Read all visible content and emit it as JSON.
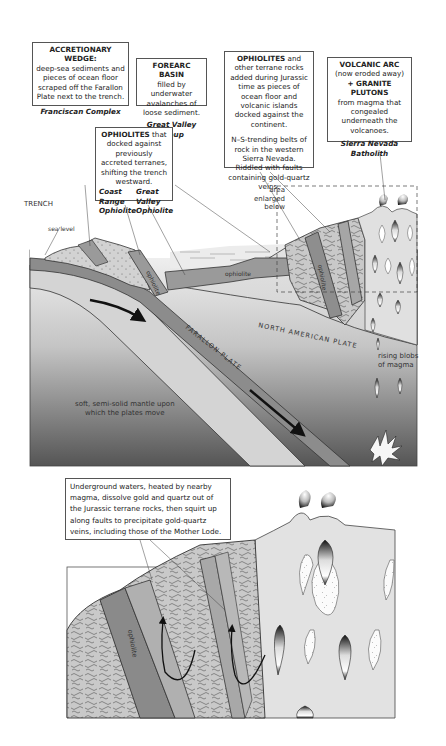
{
  "top_diagram": {
    "callouts": {
      "accretionary_wedge": {
        "title": "ACCRETIONARY WEDGE:",
        "body": "deep-sea sediments and pieces of ocean floor scraped off the Farallon Plate next to the trench.",
        "name": "Franciscan Complex"
      },
      "forearc_basin": {
        "title": "FOREARC BASIN",
        "body": "filled by underwater avalanches of loose sediment.",
        "name": "Great Valley Group"
      },
      "ophiolites_terranes": {
        "title": "OPHIOLITES",
        "body": "and other terrane rocks added during Jurassic time as pieces of ocean floor and volcanic islands docked against the continent.",
        "body2": "N–S-trending belts of rock in the western Sierra Nevada. Riddled with faults containing gold-quartz veins."
      },
      "volcanic_arc": {
        "title": "VOLCANIC ARC",
        "subtitle": "(now eroded away)",
        "title2": "+ GRANITE PLUTONS",
        "body": "from magma that congealed underneath the volcanoes.",
        "name": "Sierra Nevada Batholith"
      },
      "ophiolites_docked": {
        "title": "OPHIOLITES",
        "body": "that docked against previously accreted terranes, shifting the trench westward.",
        "name_left": "Coast Range Ophiolite",
        "name_right": "Great Valley Ophiolite",
        "name_left_lines": [
          "Coast",
          "Range",
          "Ophiolite"
        ],
        "name_right_lines": [
          "Great",
          "Valley",
          "Ophiolite"
        ]
      }
    },
    "labels": {
      "trench": "TRENCH",
      "sea_level": "sea level",
      "ophiolite": "ophiolite",
      "area_enlarged": [
        "area",
        "enlarged",
        "below"
      ],
      "farallon_plate": "FARALLON PLATE",
      "north_american_plate": "NORTH AMERICAN PLATE",
      "rising_blobs": [
        "rising blobs",
        "of magma"
      ],
      "mantle": [
        "soft, semi-solid mantle upon",
        "which the plates move"
      ]
    }
  },
  "bottom_diagram": {
    "callout": "Underground waters, heated by nearby magma, dissolve gold and quartz out of the Jurassic terrane rocks, then squirt up along faults to precipitate gold-quartz veins, including those of the Mother Lode.",
    "labels": {
      "ophiolite": "ophiolite"
    }
  },
  "colors": {
    "ocean_plate": "#8c8c8c",
    "plate_light": "#c8c8c8",
    "mantle_top": "#f0f0f0",
    "mantle_bottom": "#5a5a5a",
    "terrane": "#b4b4b4",
    "ophiolite": "#8a8a8a",
    "water": "#ebebeb"
  }
}
